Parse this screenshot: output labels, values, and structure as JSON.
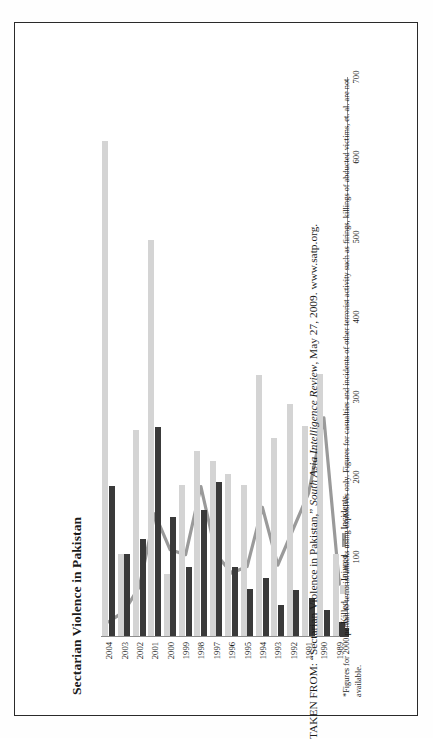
{
  "figure": {
    "title": "Sectarian Violence in Pakistan",
    "footnote": "*Figures for 2000 pertain to terrorist attacks using explosives only. Figures for casualties and incidents of other terrorist activity such as firings, killings of abducted victims, et. al. are not available.",
    "source_prefix": "TAKEN FROM: “Sectarian Violence in Pakistan,” ",
    "source_italic": "South Asia Intelligence Review",
    "source_suffix": ", May 27, 2009. www.satp.org."
  },
  "legend": {
    "items": [
      {
        "label": "Killed",
        "swatch": "square",
        "color": "#3a3a3a"
      },
      {
        "label": "Injured",
        "swatch": "square",
        "color": "#d4d4d4"
      },
      {
        "label": "Incidents",
        "swatch": "line",
        "color": "#9a9a9a"
      }
    ]
  },
  "chart_data": {
    "type": "bar",
    "title": "Sectarian Violence in Pakistan",
    "orientation": "horizontal",
    "xlabel": "",
    "ylabel": "",
    "xlim": [
      0,
      700
    ],
    "ticks": [
      100,
      200,
      300,
      400,
      500,
      600,
      700
    ],
    "grid": false,
    "legend_position": "bottom-left",
    "categories": [
      "1989",
      "1990",
      "1991",
      "1992",
      "1993",
      "1994",
      "1995",
      "1996",
      "1997",
      "1998",
      "1999",
      "2000",
      "2001",
      "2002",
      "2003",
      "2004"
    ],
    "series": [
      {
        "name": "Killed",
        "type": "bar",
        "color": "#3a3a3a",
        "values": [
          18,
          32,
          47,
          58,
          39,
          73,
          59,
          86,
          193,
          157,
          86,
          149,
          261,
          121,
          102,
          187
        ]
      },
      {
        "name": "Injured",
        "type": "bar",
        "color": "#d4d4d4",
        "values": [
          102,
          328,
          263,
          290,
          247,
          326,
          189,
          202,
          219,
          231,
          189,
          78,
          495,
          257,
          103,
          619
        ]
      },
      {
        "name": "Incidents",
        "type": "line",
        "color": "#9a9a9a",
        "values": [
          66,
          274,
          180,
          135,
          90,
          162,
          88,
          80,
          103,
          188,
          103,
          109,
          154,
          63,
          32,
          19
        ]
      }
    ]
  }
}
